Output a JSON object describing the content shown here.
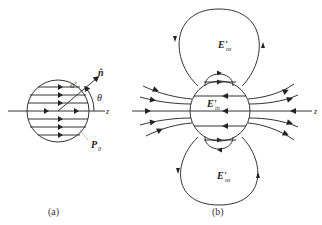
{
  "figure": {
    "panel_a": {
      "caption": "(a)",
      "labels": {
        "sigma": "σ'",
        "normal": "n̂",
        "theta": "θ",
        "axis": "z",
        "polarization": "P",
        "polarization_sub": "0"
      }
    },
    "panel_b": {
      "caption": "(b)",
      "labels": {
        "field_outside": "E'",
        "field_outside_sub": "os",
        "field_inside": "E'",
        "field_inside_sub": "in",
        "axis": "z"
      }
    }
  }
}
